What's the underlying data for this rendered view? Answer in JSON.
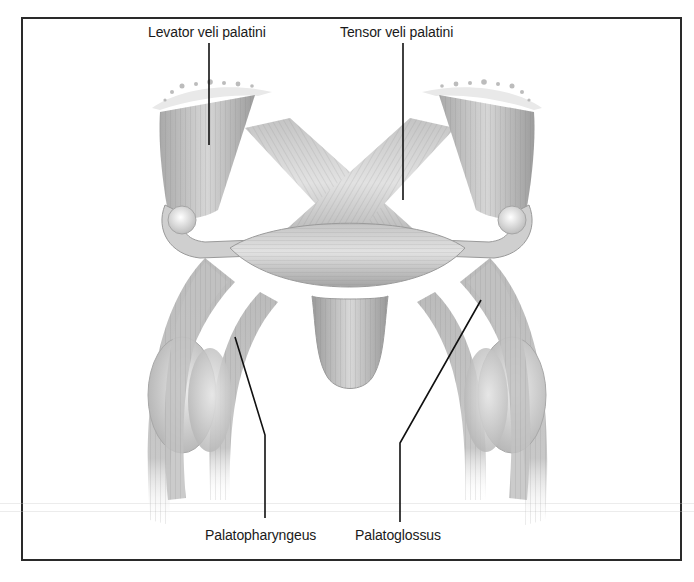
{
  "figure": {
    "labels": {
      "levator": "Levator veli palatini",
      "tensor": "Tensor veli palatini",
      "palatopharyngeus": "Palatopharyngeus",
      "palatoglossus": "Palatoglossus"
    },
    "colors": {
      "border": "#2a2a2a",
      "muscle_light": "#e4e4e4",
      "muscle_mid": "#bdbdbd",
      "muscle_dark": "#8e8e8e",
      "leader_line": "#111111",
      "text": "#1a1a1a"
    }
  }
}
